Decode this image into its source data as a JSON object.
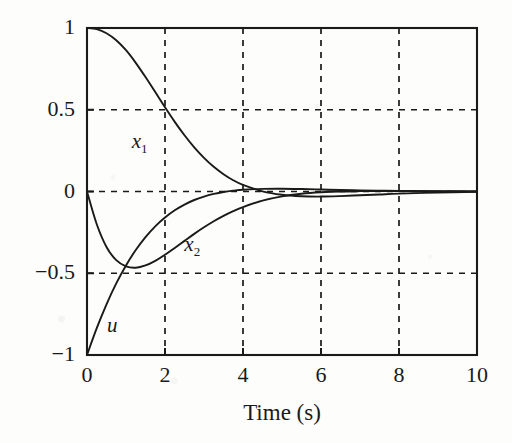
{
  "chart_data": {
    "type": "line",
    "title": "",
    "subtitle": "",
    "xlabel": "Time (s)",
    "ylabel": "",
    "xlim": [
      0,
      10
    ],
    "ylim": [
      -1,
      1
    ],
    "xticks": [
      0,
      2,
      4,
      6,
      8,
      10
    ],
    "xtick_labels": [
      "0",
      "2",
      "4",
      "6",
      "8",
      "10"
    ],
    "yticks": [
      -1,
      -0.5,
      0,
      0.5,
      1
    ],
    "ytick_labels": [
      "−1",
      "−0.5",
      "0",
      "0.5",
      "1"
    ],
    "grid": true,
    "grid_style": "dashed",
    "grid_color": "#1a1a1a",
    "legend": "inline-annotations",
    "line_color": "#1a1a1a",
    "background": "#fdfdfb",
    "annotations": [
      {
        "name": "x1",
        "text": "x",
        "sub": "1",
        "x": 1.35,
        "y": 0.3
      },
      {
        "name": "x2",
        "text": "x",
        "sub": "2",
        "x": 2.7,
        "y": -0.33
      },
      {
        "name": "u",
        "text": "u",
        "sub": "",
        "x": 0.72,
        "y": -0.82
      }
    ],
    "series": [
      {
        "name": "x1",
        "label": "x1",
        "x": [
          0,
          0.25,
          0.5,
          0.75,
          1,
          1.25,
          1.5,
          1.75,
          2,
          2.25,
          2.5,
          2.75,
          3,
          3.25,
          3.5,
          3.75,
          4,
          4.5,
          5,
          5.5,
          6,
          6.5,
          7,
          7.5,
          8,
          9,
          10
        ],
        "y": [
          1,
          0.993,
          0.968,
          0.925,
          0.864,
          0.787,
          0.7,
          0.608,
          0.515,
          0.426,
          0.344,
          0.27,
          0.206,
          0.151,
          0.106,
          0.069,
          0.04,
          0.001,
          -0.02,
          -0.029,
          -0.031,
          -0.028,
          -0.023,
          -0.018,
          -0.013,
          -0.006,
          -0.002
        ]
      },
      {
        "name": "x2",
        "label": "x2",
        "x": [
          0,
          0.25,
          0.5,
          0.75,
          1,
          1.25,
          1.5,
          1.75,
          2,
          2.25,
          2.5,
          2.75,
          3,
          3.25,
          3.5,
          3.75,
          4,
          4.5,
          5,
          5.5,
          6,
          6.5,
          7,
          7.5,
          8,
          9,
          10
        ],
        "y": [
          0,
          -0.2,
          -0.339,
          -0.42,
          -0.458,
          -0.466,
          -0.452,
          -0.424,
          -0.387,
          -0.345,
          -0.302,
          -0.259,
          -0.219,
          -0.182,
          -0.149,
          -0.12,
          -0.095,
          -0.056,
          -0.03,
          -0.014,
          -0.005,
          0.0,
          0.002,
          0.003,
          0.003,
          0.002,
          0.001
        ]
      },
      {
        "name": "u",
        "label": "u",
        "x": [
          0,
          0.25,
          0.5,
          0.75,
          1,
          1.25,
          1.5,
          1.75,
          2,
          2.25,
          2.5,
          2.75,
          3,
          3.25,
          3.5,
          3.75,
          4,
          4.5,
          5,
          5.5,
          6,
          6.5,
          7,
          7.5,
          8,
          9,
          10
        ],
        "y": [
          -1,
          -0.836,
          -0.69,
          -0.562,
          -0.452,
          -0.358,
          -0.279,
          -0.213,
          -0.159,
          -0.115,
          -0.08,
          -0.052,
          -0.031,
          -0.015,
          -0.003,
          0.005,
          0.011,
          0.016,
          0.017,
          0.015,
          0.012,
          0.009,
          0.007,
          0.005,
          0.003,
          0.001,
          0.0
        ]
      }
    ]
  }
}
